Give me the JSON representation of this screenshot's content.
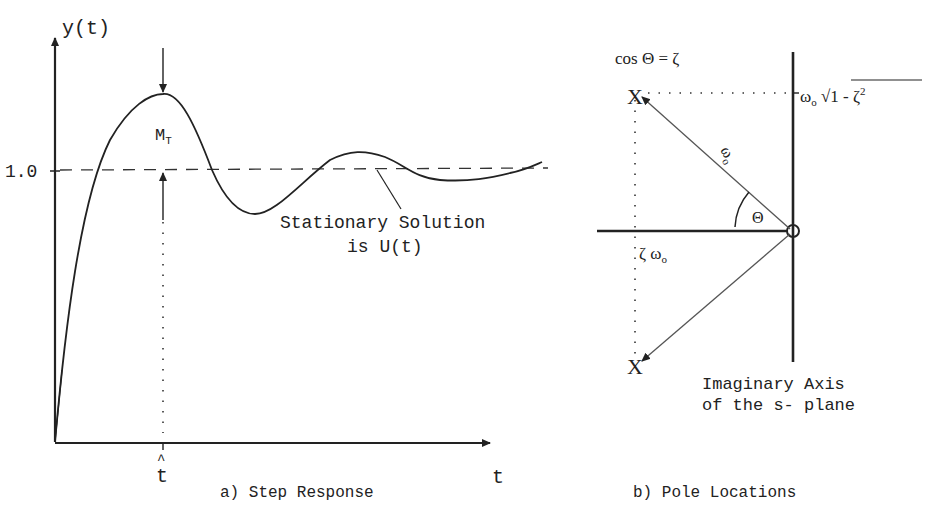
{
  "panel_a": {
    "y_axis_label": "y(t)",
    "x_axis_label": "t",
    "y_tick_label": "1.0",
    "peak_label": "M",
    "peak_label_sub": "T",
    "peak_time_label": "t",
    "peak_time_hat": "^",
    "annotation_line1": "Stationary Solution",
    "annotation_line2": "is U(t)",
    "caption": "a) Step Response"
  },
  "panel_b": {
    "relation": "cos Θ = ζ",
    "imag_label_omega": "ω",
    "imag_label_sub": "o",
    "imag_label_radicand": "1 - ζ",
    "imag_label_exp": "2",
    "vector_label": "ω",
    "vector_label_sub": "o",
    "angle_label": "Θ",
    "real_label": "ζ ω",
    "real_label_sub": "o",
    "axis_note_line1": "Imaginary Axis",
    "axis_note_line2": "of the s- plane",
    "caption": "b) Pole Locations"
  },
  "colors": {
    "ink": "#222222",
    "background": "#ffffff"
  }
}
